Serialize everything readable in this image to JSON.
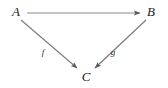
{
  "figure": {
    "type": "commutative-triangle-diagram",
    "background_color": "#ffffff",
    "stroke_color": "#6e6e6e",
    "label_color": "#1c1c1c"
  },
  "vertices": [
    {
      "id": "A",
      "label": "A",
      "x": 16,
      "y": 11
    },
    {
      "id": "B",
      "label": "B",
      "x": 151,
      "y": 11
    },
    {
      "id": "C",
      "label": "C",
      "x": 86,
      "y": 76
    }
  ],
  "edges": [
    {
      "id": "A-to-B",
      "from": "A",
      "to": "B",
      "label": "",
      "arrowhead": "end",
      "x1": 27,
      "y1": 13,
      "x2": 140,
      "y2": 13
    },
    {
      "id": "A-to-C",
      "from": "A",
      "to": "C",
      "label": "f",
      "label_x": 43,
      "label_y": 52,
      "arrowhead": "end",
      "x1": 21,
      "y1": 20,
      "x2": 77,
      "y2": 68
    },
    {
      "id": "B-to-C",
      "from": "B",
      "to": "C",
      "label": "g",
      "label_x": 113,
      "label_y": 52,
      "arrowhead": "end",
      "x1": 146,
      "y1": 20,
      "x2": 95,
      "y2": 68
    }
  ]
}
